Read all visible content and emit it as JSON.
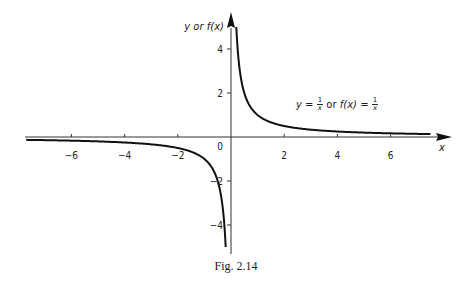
{
  "chart_data": {
    "type": "line",
    "title": "",
    "function": "y = 1/x",
    "xlabel": "x",
    "ylabel": "y or f(x)",
    "xlim": [
      -7.7,
      7.8
    ],
    "ylim": [
      -5.2,
      5.0
    ],
    "x_ticks": [
      -6,
      -4,
      -2,
      0,
      2,
      4,
      6
    ],
    "y_ticks": [
      -4,
      -2,
      2,
      4
    ],
    "grid": false,
    "annotation": "y = 1/x or f(x) = 1/x",
    "series": [
      {
        "name": "y = 1/x (x > 0)",
        "x": [
          0.2,
          0.25,
          0.33,
          0.5,
          0.75,
          1,
          1.5,
          2,
          3,
          4,
          5,
          6,
          7,
          7.5
        ],
        "y": [
          5,
          4,
          3,
          2,
          1.33,
          1,
          0.67,
          0.5,
          0.33,
          0.25,
          0.2,
          0.17,
          0.14,
          0.13
        ]
      },
      {
        "name": "y = 1/x (x < 0)",
        "x": [
          -7.7,
          -7,
          -6,
          -5,
          -4,
          -3,
          -2,
          -1.5,
          -1,
          -0.75,
          -0.5,
          -0.33,
          -0.25,
          -0.2
        ],
        "y": [
          -0.13,
          -0.14,
          -0.17,
          -0.2,
          -0.25,
          -0.33,
          -0.5,
          -0.67,
          -1,
          -1.33,
          -2,
          -3,
          -4,
          -5
        ]
      }
    ]
  },
  "labels": {
    "y_axis": "y or f(x)",
    "x_axis": "x",
    "origin": "0",
    "eq_y": "y",
    "eq_eq": " = ",
    "eq_or": " or ",
    "eq_f": "f(x)",
    "eq_num": "1",
    "eq_den": "x",
    "caption": "Fig. 2.14"
  }
}
